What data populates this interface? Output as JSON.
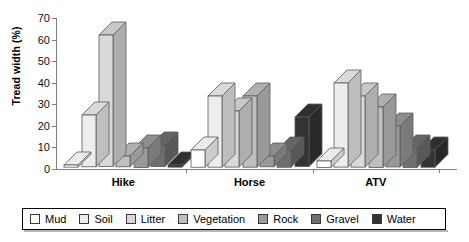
{
  "chart_data": {
    "type": "bar",
    "title": "",
    "subtitle": "",
    "xlabel": "",
    "ylabel": "Tread width (%)",
    "ylim": [
      0,
      70
    ],
    "ytick_step": 10,
    "yticks": [
      0,
      10,
      20,
      30,
      40,
      50,
      60,
      70
    ],
    "grid": false,
    "legend_position": "bottom",
    "style": "3d-column",
    "categories": [
      "Hike",
      "Horse",
      "ATV"
    ],
    "series": [
      {
        "name": "Mud",
        "color": "#ffffff",
        "values": [
          1,
          8,
          3
        ]
      },
      {
        "name": "Soil",
        "color": "#ededed",
        "values": [
          24,
          33,
          39
        ]
      },
      {
        "name": "Litter",
        "color": "#d9d9d9",
        "values": [
          61,
          26,
          33
        ]
      },
      {
        "name": "Vegetation",
        "color": "#bfbfbf",
        "values": [
          5,
          33,
          28
        ]
      },
      {
        "name": "Rock",
        "color": "#999999",
        "values": [
          9,
          5,
          19
        ]
      },
      {
        "name": "Gravel",
        "color": "#6e6e6e",
        "values": [
          10,
          8,
          9
        ]
      },
      {
        "name": "Water",
        "color": "#333333",
        "values": [
          1,
          23,
          8
        ]
      }
    ]
  },
  "axis": {
    "y_title": "Tread width (%)",
    "tick_labels": [
      "70",
      "60",
      "50",
      "40",
      "30",
      "20",
      "10",
      "0"
    ],
    "category_labels": [
      "Hike",
      "Horse",
      "ATV"
    ]
  },
  "legend": {
    "items": [
      {
        "label": "Mud",
        "color": "#ffffff"
      },
      {
        "label": "Soil",
        "color": "#ededed"
      },
      {
        "label": "Litter",
        "color": "#d9d9d9"
      },
      {
        "label": "Vegetation",
        "color": "#bfbfbf"
      },
      {
        "label": "Rock",
        "color": "#999999"
      },
      {
        "label": "Gravel",
        "color": "#6e6e6e"
      },
      {
        "label": "Water",
        "color": "#333333"
      }
    ]
  },
  "colors": {
    "axis": "#808080",
    "text": "#000000",
    "bar_outline": "#5a5a5a",
    "background": "#ffffff"
  }
}
